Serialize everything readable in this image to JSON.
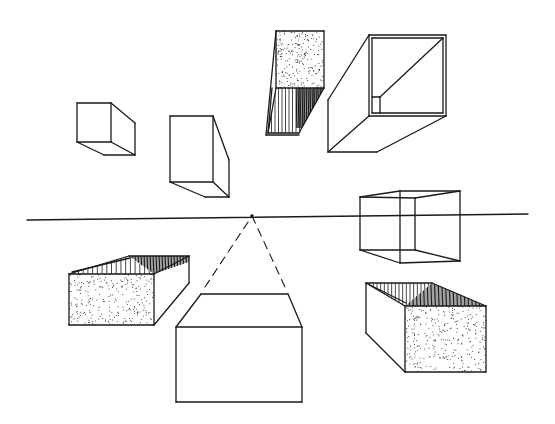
{
  "figure": {
    "width": 555,
    "height": 424,
    "background": "#ffffff",
    "ink": "#1a1a1a",
    "stroke_width": 1.3
  },
  "horizon": {
    "x1": 27,
    "y1": 220,
    "x2": 528,
    "y2": 214
  },
  "vanishing_point": {
    "x": 252,
    "y": 216
  },
  "shapes": [
    {
      "name": "box-top-left-small",
      "lines": [
        [
          77,
          103,
          111,
          103
        ],
        [
          111,
          103,
          111,
          142
        ],
        [
          111,
          142,
          77,
          142
        ],
        [
          77,
          142,
          77,
          103
        ],
        [
          111,
          103,
          135,
          123
        ],
        [
          135,
          123,
          135,
          155
        ],
        [
          135,
          155,
          104,
          155
        ],
        [
          104,
          155,
          77,
          142
        ],
        [
          111,
          142,
          135,
          155
        ]
      ]
    },
    {
      "name": "box-top-left-tall",
      "lines": [
        [
          170,
          116,
          213,
          116
        ],
        [
          213,
          116,
          213,
          182
        ],
        [
          213,
          182,
          170,
          182
        ],
        [
          170,
          182,
          170,
          116
        ],
        [
          213,
          116,
          229,
          160
        ],
        [
          229,
          160,
          229,
          197
        ],
        [
          229,
          197,
          205,
          197
        ],
        [
          205,
          197,
          170,
          182
        ],
        [
          213,
          182,
          229,
          197
        ]
      ]
    },
    {
      "name": "box-top-center-open",
      "stipple": {
        "points": [
          [
            276,
            31
          ],
          [
            324,
            31
          ],
          [
            324,
            88
          ],
          [
            276,
            88
          ]
        ],
        "count": 220
      },
      "hatch": {
        "points": [
          [
            276,
            88
          ],
          [
            324,
            88
          ],
          [
            299,
            133
          ],
          [
            268,
            133
          ]
        ],
        "count": 16
      },
      "dark_hatch": {
        "points": [
          [
            296,
            88
          ],
          [
            324,
            88
          ],
          [
            302,
            128
          ],
          [
            296,
            128
          ]
        ],
        "count": 14
      },
      "lines": [
        [
          276,
          31,
          324,
          31
        ],
        [
          324,
          31,
          324,
          88
        ],
        [
          324,
          88,
          276,
          88
        ],
        [
          276,
          88,
          276,
          31
        ],
        [
          276,
          31,
          266,
          135
        ],
        [
          276,
          88,
          268,
          133
        ],
        [
          324,
          88,
          299,
          133
        ],
        [
          266,
          135,
          299,
          135
        ],
        [
          268,
          133,
          299,
          133
        ],
        [
          272,
          88,
          268,
          133
        ]
      ]
    },
    {
      "name": "box-top-right-hollow",
      "lines": [
        [
          369,
          35,
          446,
          35
        ],
        [
          446,
          35,
          446,
          116
        ],
        [
          446,
          116,
          369,
          116
        ],
        [
          369,
          116,
          369,
          35
        ],
        [
          372,
          38,
          443,
          38
        ],
        [
          443,
          38,
          443,
          113
        ],
        [
          443,
          113,
          372,
          113
        ],
        [
          372,
          113,
          372,
          38
        ],
        [
          369,
          35,
          328,
          100
        ],
        [
          328,
          100,
          328,
          152
        ],
        [
          328,
          152,
          377,
          152
        ],
        [
          377,
          152,
          446,
          116
        ],
        [
          328,
          152,
          369,
          116
        ],
        [
          443,
          38,
          380,
          97
        ],
        [
          372,
          97,
          380,
          97
        ],
        [
          380,
          97,
          380,
          113
        ]
      ]
    },
    {
      "name": "box-right-wireframe",
      "lines": [
        [
          360,
          197,
          400,
          191
        ],
        [
          400,
          191,
          460,
          191
        ],
        [
          460,
          191,
          460,
          261
        ],
        [
          460,
          261,
          400,
          263
        ],
        [
          400,
          263,
          360,
          250
        ],
        [
          360,
          250,
          360,
          197
        ],
        [
          360,
          197,
          415,
          198
        ],
        [
          415,
          198,
          415,
          250
        ],
        [
          415,
          250,
          360,
          250
        ],
        [
          400,
          191,
          400,
          263
        ],
        [
          415,
          198,
          460,
          191
        ],
        [
          415,
          250,
          460,
          261
        ]
      ]
    },
    {
      "name": "box-bottom-left-open",
      "stipple": {
        "points": [
          [
            69,
            274
          ],
          [
            154,
            274
          ],
          [
            154,
            325
          ],
          [
            69,
            325
          ]
        ],
        "count": 260
      },
      "hatch": {
        "points": [
          [
            69,
            274
          ],
          [
            129,
            256
          ],
          [
            154,
            274
          ]
        ],
        "count": 18
      },
      "dark_hatch": {
        "points": [
          [
            129,
            256
          ],
          [
            189,
            256
          ],
          [
            189,
            262
          ],
          [
            154,
            274
          ]
        ],
        "count": 20
      },
      "lines": [
        [
          69,
          274,
          154,
          274
        ],
        [
          154,
          274,
          154,
          325
        ],
        [
          154,
          325,
          69,
          325
        ],
        [
          69,
          325,
          69,
          274
        ],
        [
          69,
          274,
          129,
          256
        ],
        [
          129,
          256,
          189,
          256
        ],
        [
          189,
          256,
          189,
          283
        ],
        [
          189,
          283,
          154,
          325
        ],
        [
          154,
          274,
          189,
          256
        ],
        [
          72,
          272,
          130,
          258
        ]
      ]
    },
    {
      "name": "box-bottom-center-solid",
      "lines": [
        [
          176,
          327,
          302,
          327
        ],
        [
          302,
          327,
          302,
          402
        ],
        [
          302,
          402,
          176,
          402
        ],
        [
          176,
          402,
          176,
          327
        ],
        [
          176,
          327,
          201,
          294
        ],
        [
          201,
          294,
          288,
          294
        ],
        [
          288,
          294,
          302,
          327
        ]
      ],
      "dashed": [
        [
          205,
          287,
          252,
          216
        ],
        [
          252,
          216,
          285,
          287
        ]
      ]
    },
    {
      "name": "box-bottom-right-open",
      "stipple": {
        "points": [
          [
            405,
            306
          ],
          [
            486,
            306
          ],
          [
            486,
            372
          ],
          [
            405,
            372
          ]
        ],
        "count": 300
      },
      "hatch": {
        "points": [
          [
            366,
            283
          ],
          [
            432,
            283
          ],
          [
            405,
            306
          ]
        ],
        "count": 18
      },
      "dark_hatch": {
        "points": [
          [
            432,
            283
          ],
          [
            486,
            306
          ],
          [
            405,
            306
          ]
        ],
        "count": 22
      },
      "lines": [
        [
          366,
          283,
          432,
          283
        ],
        [
          432,
          283,
          486,
          306
        ],
        [
          486,
          306,
          486,
          372
        ],
        [
          486,
          372,
          405,
          372
        ],
        [
          405,
          372,
          366,
          333
        ],
        [
          366,
          333,
          366,
          283
        ],
        [
          366,
          283,
          405,
          306
        ],
        [
          405,
          306,
          405,
          372
        ],
        [
          405,
          306,
          486,
          306
        ],
        [
          370,
          285,
          406,
          303
        ]
      ]
    }
  ]
}
